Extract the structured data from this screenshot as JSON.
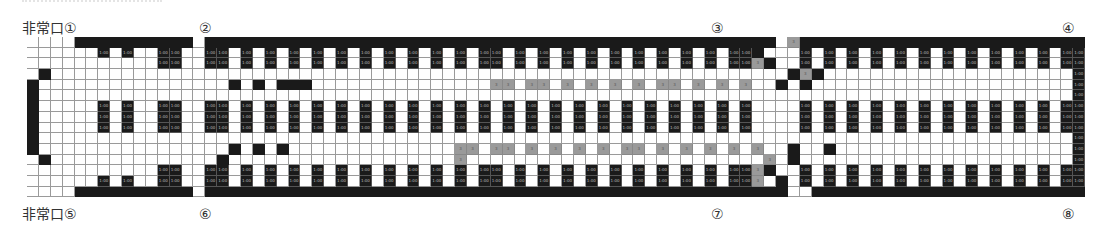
{
  "labels": {
    "exit_top_left": "非常口①",
    "exit_bottom_left": "非常口⑤",
    "n2": "②",
    "n3": "③",
    "n4": "④",
    "n6": "⑥",
    "n7": "⑦",
    "n8": "⑧"
  },
  "seat_label": "1:00",
  "gray_label": "3",
  "legend": {
    ".": "empty",
    "#": "wall",
    "S": "seat",
    "G": "gray-seat"
  },
  "grid": {
    "cols": 89,
    "rows": [
      "....##########.################################################.G#########################...#",
      "......S.S..SS..SS.S.S.S.S.S.S.S.S.S.S.SS.S.S.S.S.S.S.S.S.S.SS#...S.S.S.S.S.S.S.S.S.S.S.S.S.....S",
      "...........SS..SS.S.S.S.S.S.S.S.S.S.S.SS.S.S.S.S.S.S.S.S.S.SSG#..S.S.S.S.S.S.S.S.S.S.S.S.S.....S",
      ".#..............................................................#G#...........................S",
      "#................#.#.###...............GG.GG.G.G.G.G.GG.G.G.G..#.#...........................S",
      "#................................................................................................S",
      "#.....S.S..SS..SS.S.S.S.S.S.S.S.S.S.S.S.S.S.S.S.S.S.S.S.S.S.S....S.S.S.S.S.S.S.S.S.S.S.S.S.....S",
      "#.....S.S..SS..SS.S.S.S.S.S.S.S.S.S.S.S.S.S.S.S.S.S.S.S.S.S.S....S.S.S.S.S.S.S.S.S.S.S.S.S.....S",
      "#.....S.S..SS..SS.S.S.S.S.S.S.S.S.S.S.S.S.S.S.S.S.S.S.S.S.S.S....S.S.S.S.S.S.S.S.S.S.S.S.S.....S",
      "#...............................................................................................S",
      "#................#.#.#..............GG.GG.G.G.G.G.GG.G.G.G.G.G..#..#..........................S",
      ".#..............#...................G.........................G.#............................S",
      "...........SS..SS.S.S.S.S.S.S.S.S.S.S.SS.S.S.S.S.S.S.S.S.S.SSG#..S.S.S.S.S.S.S.S.S.S.S.S.S.....S",
      "......S.S..SS..SS.S.S.S.S.S.S.S.S.S.S.SS.S.S.S.S.S.S.S.S.S.SSG.#.S.S.S.S.S.S.S.S.S.S.S.S.S.....S",
      "....##########.#################################################..#########################...#"
    ]
  }
}
